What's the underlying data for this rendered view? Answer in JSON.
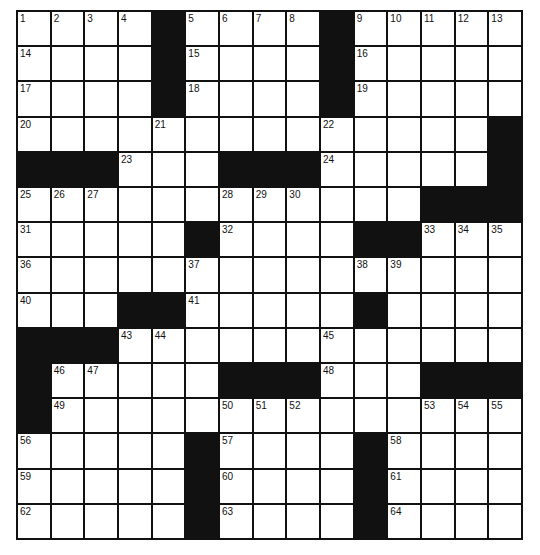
{
  "puzzle": {
    "rows": 15,
    "cols": 15,
    "colors": {
      "black": "#111111",
      "white": "#ffffff",
      "line": "#111111"
    },
    "layout": [
      "....#....#.....",
      "....#....#.....",
      "....#....#.....",
      "..............#",
      "###...###.....#",
      "............###",
      ".....#....##...",
      "...............",
      "...##.....#....",
      "###............",
      "#.....###...###",
      "#..............",
      ".....#....#....",
      ".....#....#....",
      ".....#....#...."
    ],
    "numbers": [
      {
        "r": 0,
        "c": 0,
        "n": "1"
      },
      {
        "r": 0,
        "c": 1,
        "n": "2"
      },
      {
        "r": 0,
        "c": 2,
        "n": "3"
      },
      {
        "r": 0,
        "c": 3,
        "n": "4"
      },
      {
        "r": 0,
        "c": 5,
        "n": "5"
      },
      {
        "r": 0,
        "c": 6,
        "n": "6"
      },
      {
        "r": 0,
        "c": 7,
        "n": "7"
      },
      {
        "r": 0,
        "c": 8,
        "n": "8"
      },
      {
        "r": 0,
        "c": 10,
        "n": "9"
      },
      {
        "r": 0,
        "c": 11,
        "n": "10"
      },
      {
        "r": 0,
        "c": 12,
        "n": "11"
      },
      {
        "r": 0,
        "c": 13,
        "n": "12"
      },
      {
        "r": 0,
        "c": 14,
        "n": "13"
      },
      {
        "r": 1,
        "c": 0,
        "n": "14"
      },
      {
        "r": 1,
        "c": 5,
        "n": "15"
      },
      {
        "r": 1,
        "c": 10,
        "n": "16"
      },
      {
        "r": 2,
        "c": 0,
        "n": "17"
      },
      {
        "r": 2,
        "c": 5,
        "n": "18"
      },
      {
        "r": 2,
        "c": 10,
        "n": "19"
      },
      {
        "r": 3,
        "c": 0,
        "n": "20"
      },
      {
        "r": 3,
        "c": 4,
        "n": "21"
      },
      {
        "r": 3,
        "c": 9,
        "n": "22"
      },
      {
        "r": 4,
        "c": 3,
        "n": "23"
      },
      {
        "r": 4,
        "c": 9,
        "n": "24"
      },
      {
        "r": 5,
        "c": 0,
        "n": "25"
      },
      {
        "r": 5,
        "c": 1,
        "n": "26"
      },
      {
        "r": 5,
        "c": 2,
        "n": "27"
      },
      {
        "r": 5,
        "c": 6,
        "n": "28"
      },
      {
        "r": 5,
        "c": 7,
        "n": "29"
      },
      {
        "r": 5,
        "c": 8,
        "n": "30"
      },
      {
        "r": 6,
        "c": 0,
        "n": "31"
      },
      {
        "r": 6,
        "c": 6,
        "n": "32"
      },
      {
        "r": 6,
        "c": 12,
        "n": "33"
      },
      {
        "r": 6,
        "c": 13,
        "n": "34"
      },
      {
        "r": 6,
        "c": 14,
        "n": "35"
      },
      {
        "r": 7,
        "c": 0,
        "n": "36"
      },
      {
        "r": 7,
        "c": 5,
        "n": "37"
      },
      {
        "r": 7,
        "c": 10,
        "n": "38"
      },
      {
        "r": 7,
        "c": 11,
        "n": "39"
      },
      {
        "r": 8,
        "c": 0,
        "n": "40"
      },
      {
        "r": 8,
        "c": 5,
        "n": "41"
      },
      {
        "r": 8,
        "c": 10,
        "n": "42"
      },
      {
        "r": 9,
        "c": 3,
        "n": "43"
      },
      {
        "r": 9,
        "c": 4,
        "n": "44"
      },
      {
        "r": 9,
        "c": 9,
        "n": "45"
      },
      {
        "r": 10,
        "c": 1,
        "n": "46"
      },
      {
        "r": 10,
        "c": 2,
        "n": "47"
      },
      {
        "r": 10,
        "c": 9,
        "n": "48"
      },
      {
        "r": 11,
        "c": 1,
        "n": "49"
      },
      {
        "r": 11,
        "c": 6,
        "n": "50"
      },
      {
        "r": 11,
        "c": 7,
        "n": "51"
      },
      {
        "r": 11,
        "c": 8,
        "n": "52"
      },
      {
        "r": 11,
        "c": 12,
        "n": "53"
      },
      {
        "r": 11,
        "c": 13,
        "n": "54"
      },
      {
        "r": 11,
        "c": 14,
        "n": "55"
      },
      {
        "r": 12,
        "c": 0,
        "n": "56"
      },
      {
        "r": 12,
        "c": 6,
        "n": "57"
      },
      {
        "r": 12,
        "c": 11,
        "n": "58"
      },
      {
        "r": 13,
        "c": 0,
        "n": "59"
      },
      {
        "r": 13,
        "c": 6,
        "n": "60"
      },
      {
        "r": 13,
        "c": 11,
        "n": "61"
      },
      {
        "r": 14,
        "c": 0,
        "n": "62"
      },
      {
        "r": 14,
        "c": 6,
        "n": "63"
      },
      {
        "r": 14,
        "c": 11,
        "n": "64"
      }
    ]
  }
}
